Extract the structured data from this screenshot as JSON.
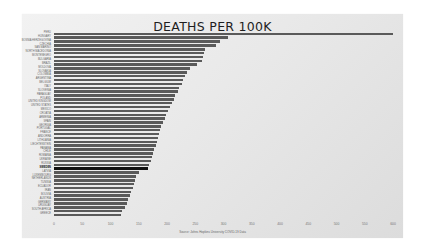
{
  "chart_data": {
    "type": "bar",
    "orientation": "horizontal",
    "title": "DEATHS PER 100K",
    "xlabel": "Source: Johns Hopkins University COVID-19 Data",
    "xlabel_note": "uncertain reading - text illegible at source resolution",
    "ylabel": "",
    "xlim": [
      0,
      600
    ],
    "xticks": [
      0,
      50,
      100,
      150,
      200,
      250,
      300,
      350,
      400,
      450,
      500,
      550,
      600
    ],
    "grid": false,
    "legend": null,
    "highlight_category": "SWEDEN",
    "labels_note": "country labels are best-effort readings; most were illegible at source resolution",
    "categories": [
      "PERU",
      "HUNGARY",
      "BOSNIA HERZEGOVINA",
      "CZECHIA",
      "SAN MARINO",
      "NORTH MACEDONIA",
      "MONTENEGRO",
      "BULGARIA",
      "BRAZIL",
      "MOLDOVA",
      "SLOVAKIA",
      "COLOMBIA",
      "ARGENTINA",
      "BELGIUM",
      "ITALY",
      "SLOVENIA",
      "PARAGUAY",
      "POLAND",
      "UNITED KINGDOM",
      "UNITED STATES",
      "MEXICO",
      "CROATIA",
      "ARMENIA",
      "SPAIN",
      "GEORGIA",
      "PORTUGAL",
      "FRANCE",
      "ANDORRA",
      "LITHUANIA",
      "LIECHTENSTEIN",
      "PANAMA",
      "CHILE",
      "ROMANIA",
      "UKRAINE",
      "RUSSIA",
      "SWEDEN",
      "LATVIA",
      "LUXEMBOURG",
      "NETHERLANDS",
      "TUNISIA",
      "ECUADOR",
      "IRAN",
      "BOLIVIA",
      "AUSTRIA",
      "GERMANY",
      "URUGUAY",
      "SOUTH AFRICA",
      "GREECE"
    ],
    "values": [
      600,
      308,
      294,
      286,
      267,
      265,
      264,
      262,
      253,
      240,
      236,
      232,
      228,
      226,
      222,
      219,
      214,
      212,
      208,
      206,
      202,
      198,
      196,
      193,
      190,
      188,
      186,
      184,
      182,
      180,
      177,
      175,
      173,
      171,
      168,
      166,
      150,
      146,
      143,
      141,
      139,
      136,
      134,
      131,
      129,
      125,
      121,
      118
    ]
  }
}
